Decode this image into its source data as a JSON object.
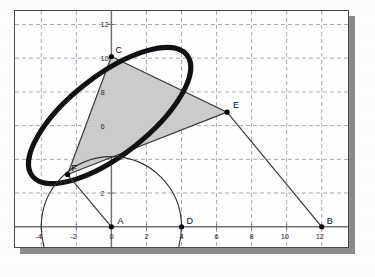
{
  "figure": {
    "title": "",
    "background_color": "#ffffff",
    "frame_border_color": "#4a4a4a",
    "shadow_color": "#8b8b8b",
    "grid_color": "#a9a9c0",
    "axis_color": "#707070",
    "ellipse_color": "#101010",
    "triangle_fill": "#cccccc",
    "triangle_stroke": "#3a3a3a",
    "circle_stroke": "#303030"
  },
  "axes": {
    "x_ticks": [
      "-4",
      "-2",
      "0",
      "2",
      "4",
      "6",
      "8",
      "10",
      "12"
    ],
    "x_values": [
      -4,
      -2,
      0,
      2,
      4,
      6,
      8,
      10,
      12
    ],
    "y_ticks": [
      "2",
      "6",
      "8",
      "10",
      "12"
    ],
    "y_values": [
      2,
      6,
      8,
      10,
      12
    ],
    "x_range": [
      -5.5,
      13.5
    ],
    "y_range": [
      -1.2,
      12.8
    ],
    "grid_step": 2,
    "grid_style": "dashed"
  },
  "points": [
    {
      "name": "A",
      "label": "A",
      "x": 0,
      "y": 0,
      "label_dx": 6,
      "label_dy": -3
    },
    {
      "name": "D",
      "label": "D",
      "x": 4,
      "y": 0,
      "label_dx": 5,
      "label_dy": -3
    },
    {
      "name": "B",
      "label": "B",
      "x": 12,
      "y": 0,
      "label_dx": 5,
      "label_dy": -3
    },
    {
      "name": "C",
      "label": "C",
      "x": 0,
      "y": 10.1,
      "label_dx": 4,
      "label_dy": -4
    },
    {
      "name": "E",
      "label": "E",
      "x": 6.6,
      "y": 6.8,
      "label_dx": 6,
      "label_dy": -4
    },
    {
      "name": "F",
      "label": "F",
      "x": -2.5,
      "y": 3.1,
      "label_dx": 4,
      "label_dy": -4
    }
  ],
  "chart_data": {
    "type": "scatter",
    "xlabel": "",
    "ylabel": "",
    "xlim": [
      -5.5,
      13.5
    ],
    "ylim": [
      -1.2,
      12.8
    ],
    "grid": true,
    "legend": null,
    "series": [
      {
        "name": "triangle-CEF",
        "type": "polygon",
        "points": [
          [
            0,
            10.1
          ],
          [
            6.6,
            6.8
          ],
          [
            -2.5,
            3.1
          ]
        ],
        "fill": "#cccccc",
        "stroke": "#3a3a3a"
      },
      {
        "name": "ellipse",
        "type": "ellipse",
        "center": [
          -0.1,
          6.6
        ],
        "rx": 5.6,
        "ry": 2.35,
        "rotation_deg": -38,
        "stroke": "#101010",
        "stroke_width": 5
      },
      {
        "name": "circle-A-radius-4",
        "type": "circle",
        "center": [
          0,
          0
        ],
        "r": 4,
        "stroke": "#303030",
        "fill": "none"
      },
      {
        "name": "segment-E-B",
        "type": "line",
        "points": [
          [
            6.6,
            6.8
          ],
          [
            12,
            0
          ]
        ],
        "stroke": "#3a3a3a"
      },
      {
        "name": "segment-A-F",
        "type": "line",
        "points": [
          [
            0,
            0
          ],
          [
            -2.5,
            3.1
          ]
        ],
        "stroke": "#3a3a3a"
      }
    ],
    "annotations": [
      {
        "text": "A",
        "x": 0,
        "y": 0
      },
      {
        "text": "B",
        "x": 12,
        "y": 0
      },
      {
        "text": "C",
        "x": 0,
        "y": 10.1
      },
      {
        "text": "D",
        "x": 4,
        "y": 0
      },
      {
        "text": "E",
        "x": 6.6,
        "y": 6.8
      },
      {
        "text": "F",
        "x": -2.5,
        "y": 3.1
      }
    ]
  }
}
